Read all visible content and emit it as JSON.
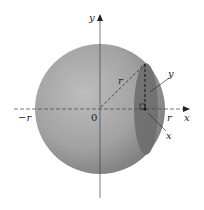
{
  "diagram": {
    "type": "sphere-cross-section",
    "labels": {
      "y_axis": "y",
      "x_axis": "x",
      "origin": "0",
      "neg_r": "−r",
      "pos_r": "r",
      "radius": "r",
      "slice_y": "y",
      "slice_x": "x"
    },
    "colors": {
      "sphere_light": "#b4b4b4",
      "sphere_dark": "#7e7e7e",
      "slice": "#6e6e6e",
      "axis": "#333333"
    }
  }
}
